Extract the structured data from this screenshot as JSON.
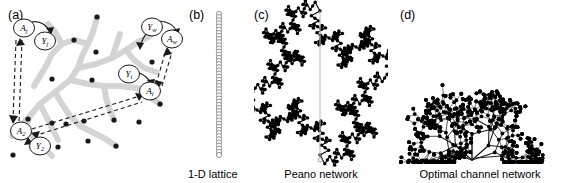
{
  "figure": {
    "width": 572,
    "height": 183,
    "background": "#ffffff",
    "line_color": "#000000",
    "river_color": "#d4d4d4"
  },
  "panels": [
    {
      "id": "a",
      "letter": "(a)",
      "caption": "",
      "description": "river network with causal graph nodes",
      "nodes": [
        {
          "label": "A",
          "sub": "j",
          "x": 24,
          "y": 28
        },
        {
          "label": "Y",
          "sub": "j",
          "x": 45,
          "y": 40
        },
        {
          "label": "Y",
          "sub": "w",
          "x": 152,
          "y": 27
        },
        {
          "label": "A",
          "sub": "w",
          "x": 172,
          "y": 38
        },
        {
          "label": "Y",
          "sub": "i",
          "x": 129,
          "y": 74
        },
        {
          "label": "A",
          "sub": "i",
          "x": 149,
          "y": 90
        },
        {
          "label": "A",
          "sub": "2",
          "x": 21,
          "y": 131
        },
        {
          "label": "Y",
          "sub": "2",
          "x": 39,
          "y": 145
        }
      ]
    },
    {
      "id": "b",
      "letter": "(b)",
      "caption": "1-D lattice",
      "description": "vertical chain of open circles",
      "lattice": {
        "count": 46,
        "cx": 33,
        "top": 14,
        "bottom": 155,
        "radius": 2.6
      }
    },
    {
      "id": "c",
      "letter": "(c)",
      "caption": "Peano network",
      "description": "diamond-shaped Peano fractal basin"
    },
    {
      "id": "d",
      "letter": "(d)",
      "caption": "Optimal channel network",
      "description": "dendritic tree draining to bottom center"
    }
  ]
}
